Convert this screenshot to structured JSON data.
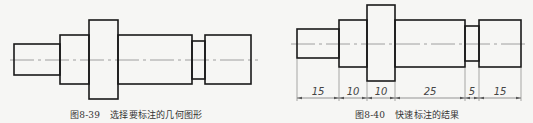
{
  "figures": [
    {
      "id": "left",
      "caption_number": "图8-39",
      "caption_text": "选择要标注的几何图形",
      "segments": [
        {
          "x1": 14,
          "x2": 60,
          "y1": 44,
          "y2": 75
        },
        {
          "x1": 60,
          "x2": 89,
          "y1": 35,
          "y2": 84
        },
        {
          "x1": 89,
          "x2": 118,
          "y1": 20,
          "y2": 99
        },
        {
          "x1": 118,
          "x2": 192,
          "y1": 35,
          "y2": 84
        },
        {
          "x1": 192,
          "x2": 205,
          "y1": 41,
          "y2": 79
        },
        {
          "x1": 205,
          "x2": 251,
          "y1": 35,
          "y2": 84
        }
      ],
      "centerline": {
        "y": 60,
        "x1": 10,
        "x2": 258
      }
    },
    {
      "id": "right",
      "caption_number": "图8-40",
      "caption_text": "快速标注的结果",
      "segments": [
        {
          "x1": 297,
          "x2": 339,
          "y1": 29,
          "y2": 58
        },
        {
          "x1": 339,
          "x2": 367,
          "y1": 20,
          "y2": 67
        },
        {
          "x1": 367,
          "x2": 395,
          "y1": 5,
          "y2": 81
        },
        {
          "x1": 395,
          "x2": 465,
          "y1": 20,
          "y2": 67
        },
        {
          "x1": 465,
          "x2": 479,
          "y1": 26,
          "y2": 61
        },
        {
          "x1": 479,
          "x2": 521,
          "y1": 20,
          "y2": 67
        }
      ],
      "centerline": {
        "y": 44,
        "x1": 291,
        "x2": 528
      },
      "dimension_line_y": 98,
      "dimensions": [
        "15",
        "10",
        "10",
        "25",
        "5",
        "15"
      ]
    }
  ],
  "colors": {
    "outline": "#1a1a1a",
    "centerline": "#8a8a8a",
    "dimension": "#555555",
    "background": "#f6f6f4"
  }
}
